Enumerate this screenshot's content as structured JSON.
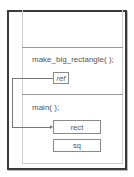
{
  "diagram": {
    "frames": [
      {
        "name": "make_big_rectangle",
        "label": "make_big_rectangle( );",
        "variables": [
          {
            "name": "ref"
          }
        ]
      },
      {
        "name": "main",
        "label": "main( );",
        "variables": [
          {
            "name": "rect"
          },
          {
            "name": "sq"
          }
        ]
      }
    ],
    "references": [
      {
        "from": "ref",
        "to": "rect"
      }
    ],
    "colors": {
      "border": "#3a3a3a",
      "line": "#777777",
      "text": "#555555"
    }
  }
}
